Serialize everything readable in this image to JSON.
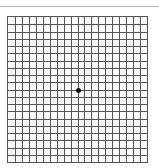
{
  "figure": {
    "type": "amsler-grid",
    "columns": 20,
    "rows": 20,
    "line_color": "#555555",
    "rule_color": "#b8b8b8",
    "dot_color": "#111111",
    "center_dot": true
  }
}
